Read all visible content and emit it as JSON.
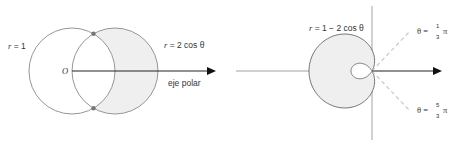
{
  "left_figure": {
    "label_circle": "r = 1",
    "label_circle_r": "r",
    "label_circle_rest": " = 1",
    "label_curve": "r = 2 cos θ",
    "label_curve_r": "r",
    "label_curve_rest": " = 2 cos θ",
    "origin_label": "O",
    "axis_label": "eje polar",
    "shade_color": "#efefef",
    "line_color": "#8a8a8a",
    "point_color": "#777777"
  },
  "right_figure": {
    "label_curve": "r = 1 − 2 cos θ",
    "label_curve_r": "r",
    "label_curve_rest": " = 1 − 2 cos θ",
    "angle1": {
      "prefix": "θ = ",
      "num": "1",
      "den": "3",
      "suffix": "π"
    },
    "angle2": {
      "prefix": "θ = ",
      "num": "5",
      "den": "3",
      "suffix": "π"
    },
    "shade_color": "#efefef",
    "line_color": "#8a8a8a",
    "dash_color": "#c8c8c8"
  }
}
